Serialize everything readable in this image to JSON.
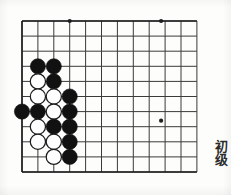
{
  "page": {
    "width": 231,
    "height": 195,
    "background_color": "#fdfdfc",
    "label": "Go problem diagram"
  },
  "board": {
    "title": "go-board",
    "line_color": "#3a3a3a",
    "border_color": "#1e1e1e",
    "columns": 12,
    "rows": 11,
    "origin_x": 22,
    "origin_y": 21,
    "cell_width": 15.9,
    "cell_height": 15.1,
    "line_width": 1,
    "border_width": 1.6,
    "star_points": [
      {
        "col": 4,
        "row": 1,
        "x": 69.7,
        "y": 21
      },
      {
        "col": 10,
        "row": 1,
        "x": 161.1,
        "y": 21
      },
      {
        "col": 10,
        "row": 8,
        "x": 161.1,
        "y": 120.7
      }
    ],
    "star_radius": 2.1
  },
  "stones": {
    "black_color": "#111111",
    "white_color": "#fefefe",
    "white_edge_color": "#1c1c1c",
    "radius": 7.6,
    "list": [
      {
        "id": "b1",
        "color": "black",
        "col": 2,
        "row": 4,
        "x": 37.9,
        "y": 66.3
      },
      {
        "id": "b2",
        "color": "black",
        "col": 3,
        "row": 4,
        "x": 53.8,
        "y": 66.3
      },
      {
        "id": "w1",
        "color": "white",
        "col": 2,
        "row": 5,
        "x": 37.9,
        "y": 81.4
      },
      {
        "id": "b3",
        "color": "black",
        "col": 3,
        "row": 5,
        "x": 53.8,
        "y": 81.4
      },
      {
        "id": "w2",
        "color": "white",
        "col": 2,
        "row": 6,
        "x": 37.9,
        "y": 96.5
      },
      {
        "id": "w3",
        "color": "white",
        "col": 3,
        "row": 6,
        "x": 53.8,
        "y": 96.5
      },
      {
        "id": "b4",
        "color": "black",
        "col": 4,
        "row": 6,
        "x": 69.7,
        "y": 96.5
      },
      {
        "id": "b5",
        "color": "black",
        "col": 1,
        "row": 7,
        "x": 22.0,
        "y": 111.6
      },
      {
        "id": "b6",
        "color": "black",
        "col": 2,
        "row": 7,
        "x": 37.9,
        "y": 111.6
      },
      {
        "id": "w4",
        "color": "white",
        "col": 3,
        "row": 7,
        "x": 53.8,
        "y": 111.6
      },
      {
        "id": "b7",
        "color": "black",
        "col": 4,
        "row": 7,
        "x": 69.7,
        "y": 111.6
      },
      {
        "id": "w5",
        "color": "white",
        "col": 2,
        "row": 8,
        "x": 37.9,
        "y": 126.7
      },
      {
        "id": "b8",
        "color": "black",
        "col": 3,
        "row": 8,
        "x": 53.8,
        "y": 126.7
      },
      {
        "id": "b9",
        "color": "black",
        "col": 4,
        "row": 8,
        "x": 69.7,
        "y": 126.7
      },
      {
        "id": "w6",
        "color": "white",
        "col": 2,
        "row": 9,
        "x": 37.9,
        "y": 141.8
      },
      {
        "id": "w7",
        "color": "white",
        "col": 3,
        "row": 9,
        "x": 53.8,
        "y": 141.8
      },
      {
        "id": "b10",
        "color": "black",
        "col": 4,
        "row": 9,
        "x": 69.7,
        "y": 141.8
      },
      {
        "id": "w8",
        "color": "white",
        "col": 3,
        "row": 10,
        "x": 53.8,
        "y": 156.9
      },
      {
        "id": "b11",
        "color": "black",
        "col": 4,
        "row": 10,
        "x": 69.7,
        "y": 156.9
      }
    ]
  },
  "labels": {
    "rank_text": "初级",
    "rank_meaning": "elementary-level"
  }
}
